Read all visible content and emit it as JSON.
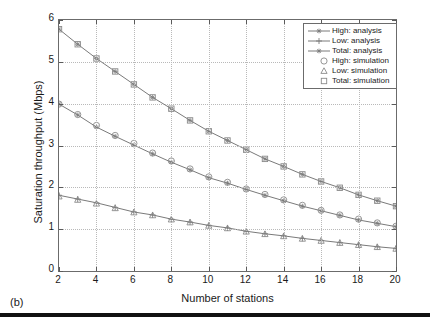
{
  "caption": "(b)",
  "legend": {
    "position": "top-right",
    "items": [
      {
        "label": "High: analysis",
        "marker": "star-line",
        "kind": "line"
      },
      {
        "label": "Low: analysis",
        "marker": "plus-line",
        "kind": "line"
      },
      {
        "label": "Total: analysis",
        "marker": "star-line",
        "kind": "line"
      },
      {
        "label": "High: simulation",
        "marker": "circle-marker",
        "kind": "marker"
      },
      {
        "label": "Low: simulation",
        "marker": "triangle-marker",
        "kind": "marker"
      },
      {
        "label": "Total: simulation",
        "marker": "square-marker",
        "kind": "marker"
      }
    ]
  },
  "chart_data": {
    "type": "line",
    "title": "",
    "xlabel": "Number of stations",
    "ylabel": "Saturation throughput (Mbps)",
    "xlim": [
      2,
      20
    ],
    "ylim": [
      0,
      6
    ],
    "xticks": [
      2,
      4,
      6,
      8,
      10,
      12,
      14,
      16,
      18,
      20
    ],
    "yticks": [
      0,
      1,
      2,
      3,
      4,
      5,
      6
    ],
    "grid": true,
    "line_color": "#7a7a7a",
    "marker_color": "#8a8a8a",
    "x": [
      2,
      3,
      4,
      5,
      6,
      7,
      8,
      9,
      10,
      11,
      12,
      13,
      14,
      15,
      16,
      17,
      18,
      19,
      20
    ],
    "series": [
      {
        "name": "Total: analysis",
        "marker": "star",
        "values": [
          5.78,
          5.42,
          5.08,
          4.77,
          4.46,
          4.15,
          3.88,
          3.6,
          3.34,
          3.12,
          2.9,
          2.68,
          2.5,
          2.31,
          2.14,
          1.99,
          1.82,
          1.68,
          1.55
        ]
      },
      {
        "name": "High: analysis",
        "marker": "star",
        "values": [
          3.99,
          3.73,
          3.44,
          3.22,
          3.01,
          2.8,
          2.6,
          2.42,
          2.23,
          2.1,
          1.95,
          1.81,
          1.68,
          1.55,
          1.44,
          1.33,
          1.22,
          1.14,
          1.06
        ]
      },
      {
        "name": "Low: analysis",
        "marker": "plus",
        "values": [
          1.81,
          1.72,
          1.63,
          1.52,
          1.41,
          1.34,
          1.24,
          1.17,
          1.09,
          1.03,
          0.95,
          0.89,
          0.84,
          0.78,
          0.73,
          0.68,
          0.63,
          0.58,
          0.54
        ]
      },
      {
        "name": "Total: simulation",
        "marker": "square",
        "values": [
          5.78,
          5.42,
          5.08,
          4.77,
          4.46,
          4.15,
          3.88,
          3.6,
          3.34,
          3.12,
          2.9,
          2.68,
          2.5,
          2.31,
          2.14,
          1.99,
          1.82,
          1.68,
          1.55
        ]
      },
      {
        "name": "High: simulation",
        "marker": "circle",
        "values": [
          3.99,
          3.74,
          3.48,
          3.24,
          3.05,
          2.82,
          2.63,
          2.44,
          2.25,
          2.12,
          1.96,
          1.83,
          1.7,
          1.57,
          1.45,
          1.34,
          1.24,
          1.15,
          1.07
        ]
      },
      {
        "name": "Low: simulation",
        "marker": "triangle",
        "values": [
          1.78,
          1.7,
          1.61,
          1.5,
          1.4,
          1.33,
          1.23,
          1.16,
          1.08,
          1.02,
          0.94,
          0.88,
          0.83,
          0.77,
          0.72,
          0.67,
          0.62,
          0.57,
          0.53
        ]
      }
    ]
  }
}
